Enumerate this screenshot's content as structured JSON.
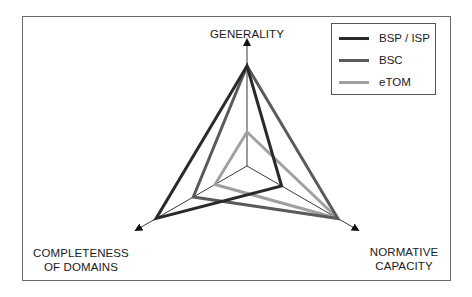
{
  "chart_data": {
    "type": "radar",
    "title": "",
    "axes": [
      "GENERALITY",
      "NORMATIVE CAPACITY",
      "COMPLETENESS OF DOMAINS"
    ],
    "axis_label_lines": {
      "generality": [
        "GENERALITY"
      ],
      "normative": [
        "NORMATIVE",
        "CAPACITY"
      ],
      "completeness": [
        "COMPLETENESS",
        "OF DOMAINS"
      ]
    },
    "range": [
      0,
      1
    ],
    "grid": false,
    "legend_position": "top-right",
    "series": [
      {
        "name": "BSP / ISP",
        "color": "#2a2a2a",
        "values": {
          "generality": 1.0,
          "normative": 0.4,
          "completeness": 1.05
        }
      },
      {
        "name": "BSC",
        "color": "#5a5a5a",
        "values": {
          "generality": 1.0,
          "normative": 1.05,
          "completeness": 0.62
        }
      },
      {
        "name": "eTOM",
        "color": "#a0a0a0",
        "values": {
          "generality": 0.34,
          "normative": 1.05,
          "completeness": 0.37
        }
      }
    ]
  },
  "legend": {
    "items": [
      {
        "label": "BSP / ISP",
        "color": "#2a2a2a"
      },
      {
        "label": "BSC",
        "color": "#5a5a5a"
      },
      {
        "label": "eTOM",
        "color": "#a0a0a0"
      }
    ]
  },
  "labels": {
    "generality": "GENERALITY",
    "normative_line1": "NORMATIVE",
    "normative_line2": "CAPACITY",
    "completeness_line1": "COMPLETENESS",
    "completeness_line2": "OF DOMAINS"
  }
}
